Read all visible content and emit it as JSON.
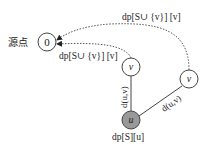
{
  "diagram": {
    "source_label": "源点",
    "nodes": {
      "source": {
        "label": "0",
        "fill": "#ffffff"
      },
      "v_near": {
        "label": "v",
        "fill": "#ffffff"
      },
      "v_far": {
        "label": "v",
        "fill": "#ffffff"
      },
      "u": {
        "label": "u",
        "fill": "#999999"
      }
    },
    "edges": {
      "u_v_near_weight": "d(u,v)",
      "u_v_far_weight": "d(u,v)"
    },
    "dp_labels": {
      "top_path": "dp[S∪ {v}] [v]",
      "near_path": "dp[S∪ {v}] [v]",
      "u_state": "dp[S][u]"
    },
    "colors": {
      "stroke": "#444444",
      "dotted": "#555555",
      "u_fill": "#999999"
    }
  }
}
